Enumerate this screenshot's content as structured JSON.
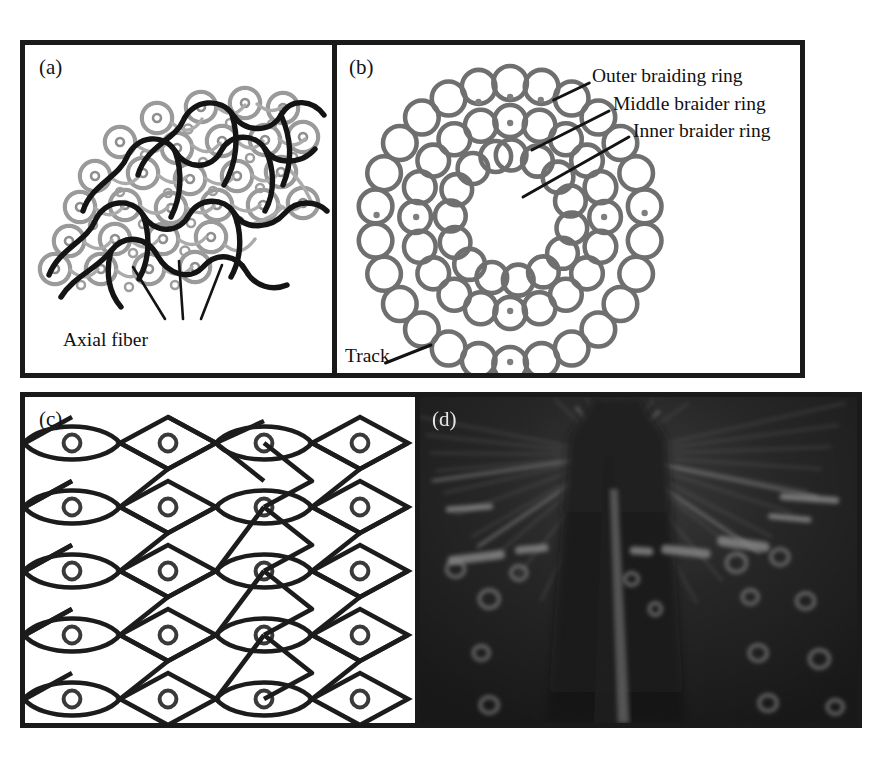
{
  "figure": {
    "panels": [
      {
        "id": "a",
        "label": "(a)",
        "caption_text": "Axial fiber",
        "kind": "schematic-cross-section",
        "description": "Braided composite cross-section: carrier rings with central axial fibers interlaced by thick dark braider yarn paths"
      },
      {
        "id": "b",
        "label": "(b)",
        "kind": "machine-bed-diagram",
        "callouts": [
          "Outer braiding ring",
          "Middle braider ring",
          "Inner braider ring",
          "Track"
        ],
        "rings": [
          {
            "name": "Outer braiding ring",
            "horn_gear_count": 26
          },
          {
            "name": "Middle braider ring",
            "horn_gear_count": 20
          },
          {
            "name": "Inner braider ring",
            "horn_gear_count": 14
          }
        ]
      },
      {
        "id": "c",
        "label": "(c)",
        "kind": "braid-lattice-unit-cell",
        "rows": 5,
        "columns": 4,
        "description": "Two-dimensional triaxial braid architecture: lens-shaped cells and diamond cells each enclosing an axial fiber circle"
      },
      {
        "id": "d",
        "label": "(d)",
        "kind": "photograph",
        "description": "Dark photograph of the braiding machine converging yarns forming the braid over the mandrel"
      }
    ]
  },
  "colors": {
    "frame_border": "#1a1a1a",
    "panel_background": "#ffffff",
    "braider_yarn": "#171717",
    "carrier_ring": "#8b8b8b",
    "photo_background": "#0b0b0b",
    "text": "#111111"
  }
}
